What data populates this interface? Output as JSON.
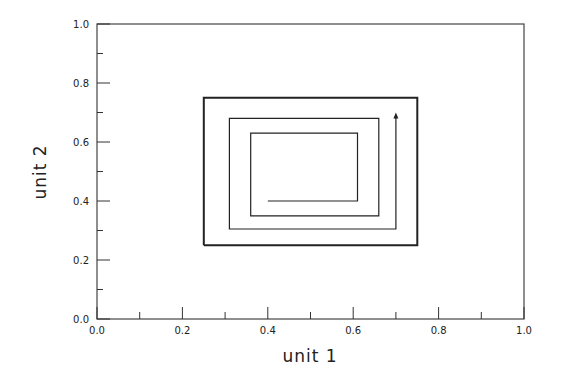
{
  "chart_data": {
    "type": "line",
    "title": "",
    "xlabel": "unit 1",
    "ylabel": "unit 2",
    "xlim": [
      0.0,
      1.0
    ],
    "ylim": [
      0.0,
      1.0
    ],
    "grid": false,
    "legend": null,
    "x_ticks": [
      "0.0",
      "0.2",
      "0.4",
      "0.6",
      "0.8",
      "1.0"
    ],
    "y_ticks": [
      "0.0",
      "0.2",
      "0.4",
      "0.6",
      "0.8",
      "1.0"
    ],
    "x_minor_ticks": [
      0.1,
      0.3,
      0.5,
      0.7,
      0.9
    ],
    "y_minor_ticks": [
      0.1,
      0.3,
      0.5,
      0.7,
      0.9
    ],
    "series": [
      {
        "name": "boundary-rectangle",
        "x": [
          0.25,
          0.75,
          0.75,
          0.25,
          0.25
        ],
        "y": [
          0.25,
          0.25,
          0.75,
          0.75,
          0.25
        ]
      },
      {
        "name": "spiral-trajectory",
        "x": [
          0.4,
          0.61,
          0.61,
          0.36,
          0.36,
          0.66,
          0.66,
          0.31,
          0.31,
          0.7,
          0.7
        ],
        "y": [
          0.4,
          0.4,
          0.63,
          0.63,
          0.35,
          0.35,
          0.68,
          0.68,
          0.305,
          0.305,
          0.69
        ],
        "end_marker": "arrow"
      }
    ]
  }
}
